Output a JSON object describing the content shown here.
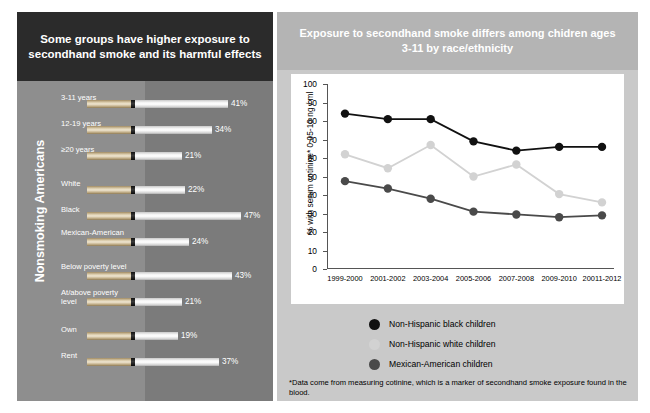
{
  "left": {
    "title": "Some groups have higher exposure to secondhand smoke and its harmful effects",
    "axis_label": "Nonsmoking Americans",
    "bars": [
      {
        "label": "3-11 years",
        "value": 41,
        "display": "41%"
      },
      {
        "label": "12-19 years",
        "value": 34,
        "display": "34%"
      },
      {
        "label": "≥20 years",
        "value": 21,
        "display": "21%"
      },
      {
        "label": "White",
        "value": 22,
        "display": "22%"
      },
      {
        "label": "Black",
        "value": 47,
        "display": "47%"
      },
      {
        "label": "Mexican-American",
        "value": 24,
        "display": "24%"
      },
      {
        "label": "Below poverty level",
        "value": 43,
        "display": "43%"
      },
      {
        "label": "At/above poverty level",
        "value": 21,
        "display": "21%"
      },
      {
        "label": "Own",
        "value": 19,
        "display": "19%"
      },
      {
        "label": "Rent",
        "value": 37,
        "display": "37%"
      }
    ]
  },
  "right": {
    "title": "Exposure to secondhand smoke differs among chidren ages 3-11 by race/ethnicity",
    "footnote": "*Data come from measuring cotinine, which is a marker of secondhand smoke exposure found in the blood."
  },
  "chart_data": {
    "type": "line",
    "title": "Exposure to secondhand smoke differs among chidren ages 3-11 by race/ethnicity",
    "xlabel": "",
    "ylabel": "% with serum cotinine* 0.05-10 ng / ml",
    "ylim": [
      0,
      100
    ],
    "yticks": [
      0,
      10,
      20,
      30,
      40,
      50,
      60,
      70,
      80,
      90,
      100
    ],
    "grid": false,
    "legend_position": "below",
    "categories": [
      "1999-2000",
      "2001-2002",
      "2003-2004",
      "2005-2006",
      "2007-2008",
      "2009-2010",
      "20011-2012"
    ],
    "series": [
      {
        "name": "Non-Hispanic black children",
        "color": "#111111",
        "values": [
          84,
          81,
          81,
          69,
          64,
          66,
          66
        ]
      },
      {
        "name": "Non-Hispanic white children",
        "color": "#d2d2d2",
        "values": [
          62,
          54.5,
          67,
          50,
          56.5,
          40.5,
          36
        ]
      },
      {
        "name": "Mexican-American children",
        "color": "#4a4a4a",
        "values": [
          47.5,
          43.5,
          38,
          31,
          29.5,
          28,
          29
        ]
      }
    ]
  }
}
